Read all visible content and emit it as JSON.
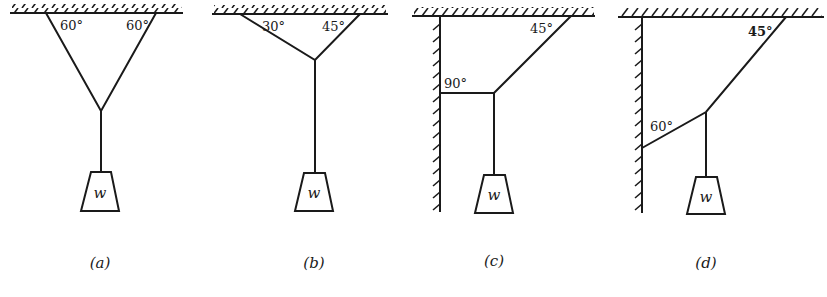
{
  "figure": {
    "panels": [
      {
        "caption": "(a)",
        "angles": [
          "60°",
          "60°"
        ],
        "weight_label": "w"
      },
      {
        "caption": "(b)",
        "angles": [
          "30°",
          "45°"
        ],
        "weight_label": "w"
      },
      {
        "caption": "(c)",
        "angles": [
          "90°",
          "45°"
        ],
        "weight_label": "w"
      },
      {
        "caption": "(d)",
        "angles": [
          "60°",
          "45°"
        ],
        "weight_label": "w"
      }
    ]
  }
}
